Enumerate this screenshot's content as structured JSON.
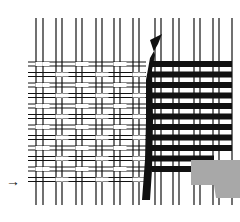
{
  "figure": {
    "arrow_glyph": "→",
    "colors": {
      "background": "#ffffff",
      "ink": "#111111",
      "gray_patch": "#a8a8a8"
    }
  }
}
